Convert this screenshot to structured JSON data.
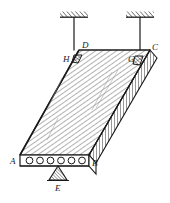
{
  "figure": {
    "name": "hollow-core-slab-isometric",
    "background": "#ffffff",
    "stroke_color": "#1a1a1a",
    "hatch_color": "#555555",
    "labels": {
      "A": "A",
      "B": "B",
      "C": "C",
      "D": "D",
      "E": "E",
      "G": "G",
      "H": "H"
    },
    "supports": {
      "ceiling_left": "ceiling-hatch-left",
      "ceiling_right": "ceiling-hatch-right",
      "hanger_left": "hanger-rod-left",
      "hanger_right": "hanger-rod-right",
      "triangle_support": "triangular-support-E"
    },
    "slab": {
      "front_face_voids": 6,
      "void_label": "hollow-core-void",
      "top_surface": "top-surface-hatched",
      "right_end_face": "right-end-section-hatched"
    }
  }
}
